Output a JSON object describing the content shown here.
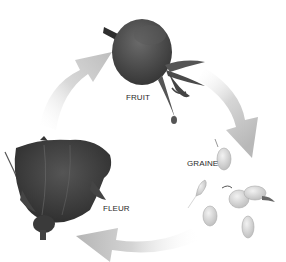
{
  "diagram": {
    "type": "life-cycle",
    "stages": [
      {
        "id": "fruit",
        "label": "FRUIT",
        "image": "rose-hip"
      },
      {
        "id": "graine",
        "label": "GRAINE",
        "image": "seeds"
      },
      {
        "id": "fleur",
        "label": "FLEUR",
        "image": "rose-bud"
      }
    ],
    "arrows": [
      {
        "from": "fleur",
        "to": "fruit"
      },
      {
        "from": "fruit",
        "to": "graine"
      },
      {
        "from": "graine",
        "to": "fleur"
      }
    ],
    "colors": {
      "background": "#ffffff",
      "arrow": "#c8c8c8",
      "fruit": "#4a4a4a",
      "flower": "#3c3c3c",
      "seed": "#d9d9d9",
      "label": "#2a2a2a"
    }
  }
}
